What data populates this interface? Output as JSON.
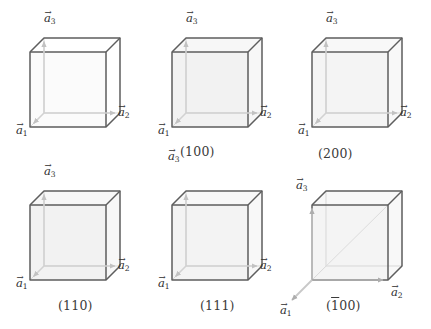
{
  "figure": {
    "type": "crystallography-miller-plane-diagram",
    "background_color": "#ffffff",
    "edge_color": "#595959",
    "hidden_edge_color": "#cfcfcf",
    "arrow_color": "#bdbdbd",
    "plane_fill_color": "#efefef",
    "text_color": "#3b3b3b"
  },
  "vectors": {
    "a1": {
      "base": "a",
      "sub": "1"
    },
    "a2": {
      "base": "a",
      "sub": "2"
    },
    "a3": {
      "base": "a",
      "sub": "3"
    }
  },
  "cells": [
    {
      "id": "cell-100",
      "label": "(100)",
      "label_plain": "100",
      "plane": "front face (100)",
      "vector_labels": {
        "a1": "a",
        "a2": "a",
        "a3": "a"
      }
    },
    {
      "id": "cell-200",
      "label": "(200)",
      "label_plain": "200",
      "plane": "mid-plane parallel to (100)",
      "vector_labels": {
        "a1": "a",
        "a2": "a",
        "a3": "a"
      }
    },
    {
      "id": "cell-200b",
      "label": "(200)",
      "label_plain": "200",
      "plane": "mid-plane parallel to (100)",
      "vector_labels": {
        "a1": "a",
        "a2": "a",
        "a3": "a"
      }
    },
    {
      "id": "cell-110",
      "label": "(110)",
      "label_plain": "110",
      "plane": "diagonal vertical plane (110)",
      "vector_labels": {
        "a1": "a",
        "a2": "a",
        "a3": "a"
      }
    },
    {
      "id": "cell-111",
      "label": "(111)",
      "label_plain": "111",
      "plane": "triangular corner plane (111)",
      "vector_labels": {
        "a1": "a",
        "a2": "a",
        "a3": "a"
      }
    },
    {
      "id": "cell-1bar00",
      "label_prefix": "(",
      "label_bar": "1",
      "label_rest": "00)",
      "label_plain": "(-100)",
      "plane": "back face (-100)",
      "vector_labels": {
        "a1": "a",
        "a2": "a",
        "a3": "a"
      }
    }
  ],
  "subscripts": {
    "one": "1",
    "two": "2",
    "three": "3"
  },
  "labels": {
    "c1": "(100)",
    "c2": "(200)",
    "c3": "(110)",
    "c4": "(111)",
    "c5_open": "(",
    "c5_bar": "1",
    "c5_rest": "00)"
  }
}
